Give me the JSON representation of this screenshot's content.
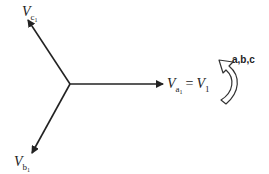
{
  "diagram": {
    "center": {
      "x": 70,
      "y": 84
    },
    "phasors": [
      {
        "name": "Va1",
        "label_main": "V",
        "label_sub": "a",
        "label_sub2": "1",
        "equals": "=",
        "rhs_main": "V",
        "rhs_sub": "1",
        "tip": {
          "x": 163,
          "y": 84
        }
      },
      {
        "name": "Vb1",
        "label_main": "V",
        "label_sub": "b",
        "label_sub2": "1",
        "tip": {
          "x": 32,
          "y": 153
        }
      },
      {
        "name": "Vc1",
        "label_main": "V",
        "label_sub": "c",
        "label_sub2": "1",
        "tip": {
          "x": 28,
          "y": 20
        }
      }
    ],
    "rotation": {
      "label": "a,b,c",
      "direction": "counter-clockwise"
    },
    "colors": {
      "line": "#222222",
      "rotation_arrow_fill": "#ffffff"
    }
  }
}
